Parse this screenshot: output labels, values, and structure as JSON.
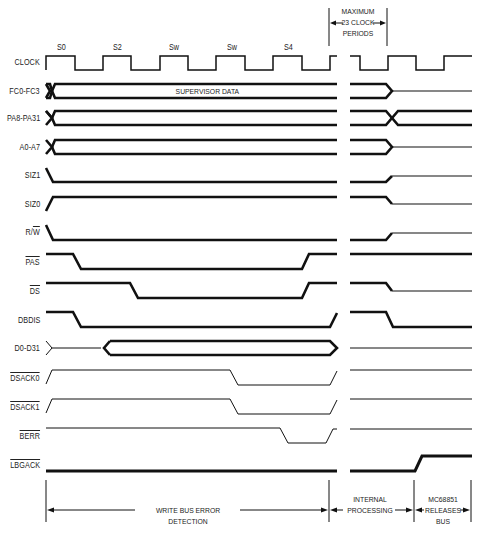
{
  "states": [
    {
      "label": "S0",
      "x": 58
    },
    {
      "label": "S2",
      "x": 114
    },
    {
      "label": "Sw",
      "x": 170
    },
    {
      "label": "Sw",
      "x": 228
    },
    {
      "label": "S4",
      "x": 284
    }
  ],
  "signals": [
    {
      "name": "CLOCK",
      "overline": false,
      "y": 63
    },
    {
      "name": "FC0-FC3",
      "overline": false,
      "y": 91
    },
    {
      "name": "PA8-PA31",
      "overline": false,
      "y": 118
    },
    {
      "name": "A0-A7",
      "overline": false,
      "y": 147
    },
    {
      "name": "SIZ1",
      "overline": false,
      "y": 175
    },
    {
      "name": "SIZ0",
      "overline": false,
      "y": 204
    },
    {
      "name": "R/W",
      "overline": false,
      "y": 232,
      "partial_overline": "W"
    },
    {
      "name": "PAS",
      "overline": true,
      "y": 262
    },
    {
      "name": "DS",
      "overline": true,
      "y": 291
    },
    {
      "name": "DBDIS",
      "overline": false,
      "y": 320
    },
    {
      "name": "D0-D31",
      "overline": false,
      "y": 348
    },
    {
      "name": "DSACK0",
      "overline": true,
      "y": 378
    },
    {
      "name": "DSACK1",
      "overline": true,
      "y": 407
    },
    {
      "name": "BERR",
      "overline": true,
      "y": 436
    },
    {
      "name": "LBGACK",
      "overline": true,
      "y": 465
    }
  ],
  "bus_labels": {
    "fc_data": "SUPERVISOR DATA"
  },
  "annotations": {
    "max_period_line1": "MAXIMUM",
    "max_period_line2": "23 CLOCK",
    "max_period_line3": "PERIODS",
    "write_bus_error": "WRITE BUS ERROR DETECTION",
    "internal_line1": "INTERNAL",
    "internal_line2": "PROCESSING",
    "release_line1": "MC68851",
    "release_line2": "RELEASES",
    "release_line3": "BUS"
  },
  "colors": {
    "line": "#111111",
    "text": "#222222",
    "background": "#ffffff"
  }
}
